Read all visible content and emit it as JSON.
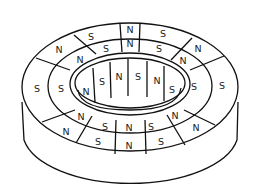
{
  "diagram": {
    "outer_ring_labels": [
      "S",
      "S",
      "N",
      "S",
      "N",
      "S",
      "N",
      "S",
      "N",
      "S",
      "N",
      "N"
    ],
    "middle_ring_labels": [
      "S",
      "N",
      "S",
      "N",
      "S",
      "S",
      "N",
      "S",
      "N",
      "S",
      "N"
    ],
    "inner_wall_labels": [
      "N",
      "S",
      "N",
      "S",
      "N",
      "S"
    ],
    "label_positions": {
      "outer": [
        {
          "t": "S",
          "x": 91,
          "y": 36
        },
        {
          "t": "N",
          "x": 130,
          "y": 29
        },
        {
          "t": "S",
          "x": 163,
          "y": 33
        },
        {
          "t": "N",
          "x": 198,
          "y": 48
        },
        {
          "t": "S",
          "x": 222,
          "y": 85
        },
        {
          "t": "N",
          "x": 196,
          "y": 127
        },
        {
          "t": "S",
          "x": 161,
          "y": 141
        },
        {
          "t": "N",
          "x": 129,
          "y": 145
        },
        {
          "t": "S",
          "x": 98,
          "y": 141
        },
        {
          "t": "N",
          "x": 66,
          "y": 131
        },
        {
          "t": "S",
          "x": 37,
          "y": 88
        },
        {
          "t": "N",
          "x": 59,
          "y": 49
        }
      ],
      "middle": [
        {
          "t": "S",
          "x": 106,
          "y": 48
        },
        {
          "t": "N",
          "x": 130,
          "y": 43
        },
        {
          "t": "S",
          "x": 159,
          "y": 48
        },
        {
          "t": "N",
          "x": 183,
          "y": 60
        },
        {
          "t": "S",
          "x": 194,
          "y": 86
        },
        {
          "t": "N",
          "x": 175,
          "y": 115
        },
        {
          "t": "S",
          "x": 151,
          "y": 126
        },
        {
          "t": "N",
          "x": 129,
          "y": 127
        },
        {
          "t": "S",
          "x": 105,
          "y": 126
        },
        {
          "t": "N",
          "x": 81,
          "y": 116
        },
        {
          "t": "S",
          "x": 61,
          "y": 88
        },
        {
          "t": "N",
          "x": 80,
          "y": 59
        }
      ],
      "inner": [
        {
          "t": "N",
          "x": 86,
          "y": 91
        },
        {
          "t": "S",
          "x": 102,
          "y": 81
        },
        {
          "t": "N",
          "x": 119,
          "y": 76
        },
        {
          "t": "S",
          "x": 138,
          "y": 76
        },
        {
          "t": "N",
          "x": 157,
          "y": 80
        },
        {
          "t": "S",
          "x": 172,
          "y": 89
        }
      ]
    }
  }
}
